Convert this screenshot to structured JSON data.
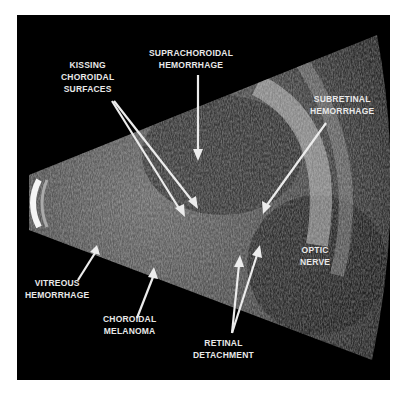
{
  "figure": {
    "background_color": "#000000",
    "label_color": "#e8e8e8"
  },
  "labels": {
    "kissing": {
      "lines": [
        "KISSING",
        "CHOROIDAL",
        "SURFACES"
      ]
    },
    "suprachoroidal": {
      "lines": [
        "SUPRACHOROIDAL",
        "HEMORRHAGE"
      ]
    },
    "subretinal": {
      "lines": [
        "SUBRETINAL",
        "HEMORRHAGE"
      ]
    },
    "optic": {
      "lines": [
        "OPTIC",
        "NERVE"
      ]
    },
    "vitreous": {
      "lines": [
        "VITREOUS",
        "HEMORRHAGE"
      ]
    },
    "melanoma": {
      "lines": [
        "CHOROIDAL",
        "MELANOMA"
      ]
    },
    "retinal": {
      "lines": [
        "RETINAL",
        "DETACHMENT"
      ]
    }
  }
}
